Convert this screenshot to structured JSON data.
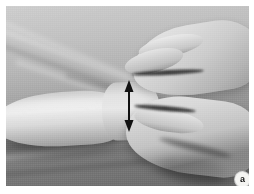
{
  "figure": {
    "kind": "clinical-photograph",
    "color_mode": "grayscale",
    "width_px": 254,
    "height_px": 194
  },
  "plate": {
    "border_color": "#ffffff",
    "background_color": "#b0b0b0",
    "margin_px": 6
  },
  "scene": {
    "background_label": "examination sheet",
    "forearm_label": "patient forearm",
    "wrist_label": "patient wrist",
    "upper_hand_label": "examiner upper hand",
    "lower_hand_label": "examiner lower hand"
  },
  "annotation": {
    "type": "double-headed-arrow",
    "orientation": "vertical",
    "color": "#111111",
    "x_px": 123,
    "y_top_px": 80,
    "y_bottom_px": 124,
    "length_px": 44,
    "shaft_width_px": 2,
    "head_width_px": 9,
    "head_length_px": 10
  },
  "badge": {
    "label": "a",
    "shape": "circle",
    "fill_color": "#f4f4f2",
    "text_color": "#141414",
    "diameter_px": 15,
    "x_px": 229,
    "y_px": 166
  }
}
